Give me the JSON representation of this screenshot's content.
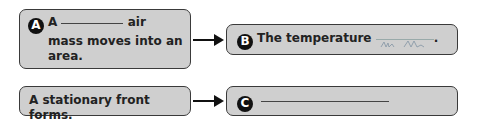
{
  "diagram": {
    "box_a": {
      "badge": "A",
      "text_before": "A",
      "text_after": "air",
      "line2": "mass moves into an",
      "line3": "area."
    },
    "box_b": {
      "badge": "B",
      "text": "The temperature",
      "period": "."
    },
    "box_stationary": {
      "text": "A stationary front forms."
    },
    "box_c": {
      "badge": "C"
    },
    "colors": {
      "box_fill": "#cfcfcf",
      "box_border": "#3a3a3a",
      "badge_bg": "#111111",
      "handwriting": "#8a9aa8"
    }
  }
}
